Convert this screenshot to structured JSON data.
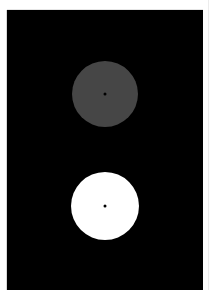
{
  "scene": {
    "background": "#ffffff",
    "panel": {
      "color": "#000000",
      "x": 7,
      "y": 10,
      "width": 196,
      "height": 280
    },
    "circles": [
      {
        "name": "upper-circle",
        "fill": "#464646",
        "cx": 105,
        "cy": 94,
        "r": 33,
        "center_dot": "#000000"
      },
      {
        "name": "lower-circle",
        "fill": "#ffffff",
        "cx": 105,
        "cy": 206,
        "r": 34,
        "center_dot": "#000000"
      }
    ]
  }
}
